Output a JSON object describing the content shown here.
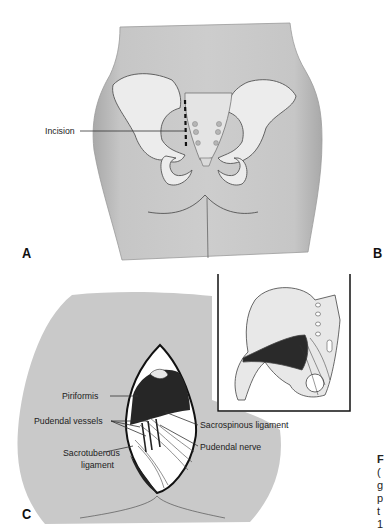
{
  "figure": {
    "panels": [
      {
        "letter": "A",
        "description": "Posterior view of pelvis within body outline showing incision site",
        "labels": [
          {
            "text": "Incision"
          }
        ]
      },
      {
        "letter": "B",
        "description": "Inset: hemipelvis with piriformis and sacral ligaments"
      },
      {
        "letter": "C",
        "description": "Gluteal incision exposing deep structures",
        "labels": [
          {
            "text": "Piriformis"
          },
          {
            "text": "Pudendal vessels"
          },
          {
            "text": "Sacrospinous ligament"
          },
          {
            "text": "Pudendal nerve"
          },
          {
            "text": "Sacrotuberous"
          },
          {
            "text": "ligament"
          }
        ]
      }
    ],
    "caption_fragments": [
      "F",
      "(",
      "g",
      "p",
      "t",
      "1"
    ]
  },
  "colors": {
    "skin": "#c9c9c9",
    "skin_shadow": "#b0b0b0",
    "bone": "#ececec",
    "line": "#333333",
    "muscle_dark": "#1e1e1e"
  }
}
